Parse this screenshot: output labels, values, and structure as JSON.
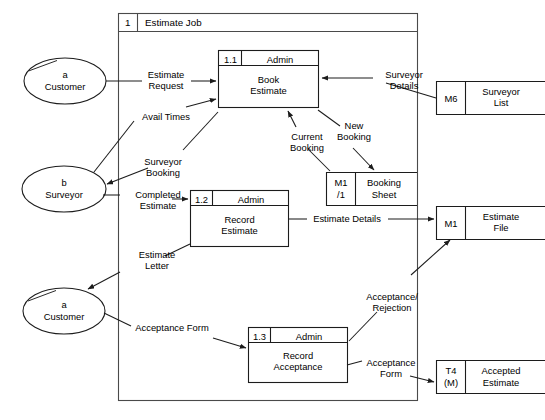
{
  "diagram": {
    "type": "data-flow-diagram",
    "title": "Estimate Job",
    "system_boundary": {
      "ref": "1",
      "label": "Estimate Job"
    },
    "external_entities": [
      {
        "id": "ext-customer-top",
        "ref": "a",
        "label": "Customer"
      },
      {
        "id": "ext-surveyor",
        "ref": "b",
        "label": "Surveyor"
      },
      {
        "id": "ext-customer-bottom",
        "ref": "a",
        "label": "Customer"
      }
    ],
    "processes": [
      {
        "id": "proc-1-1",
        "ref": "1.1",
        "actor": "Admin",
        "line1": "Book",
        "line2": "Estimate"
      },
      {
        "id": "proc-1-2",
        "ref": "1.2",
        "actor": "Admin",
        "line1": "Record",
        "line2": "Estimate"
      },
      {
        "id": "proc-1-3",
        "ref": "1.3",
        "actor": "Admin",
        "line1": "Record",
        "line2": "Acceptance"
      }
    ],
    "data_stores": [
      {
        "id": "store-m6",
        "ref": "M6",
        "ref2": "",
        "line1": "Surveyor",
        "line2": "List"
      },
      {
        "id": "store-m1-1",
        "ref": "M1",
        "ref2": "/1",
        "line1": "Booking",
        "line2": "Sheet"
      },
      {
        "id": "store-m1",
        "ref": "M1",
        "ref2": "",
        "line1": "Estimate",
        "line2": "File"
      },
      {
        "id": "store-t4",
        "ref": "T4",
        "ref2": "(M)",
        "line1": "Accepted",
        "line2": "Estimate"
      }
    ],
    "data_flows": [
      {
        "id": "flow-estimate-request",
        "line1": "Estimate",
        "line2": "Request"
      },
      {
        "id": "flow-avail-times",
        "line1": "Avail Times",
        "line2": ""
      },
      {
        "id": "flow-surveyor-details",
        "line1": "Surveyor",
        "line2": "Details"
      },
      {
        "id": "flow-current-booking",
        "line1": "Current",
        "line2": "Booking"
      },
      {
        "id": "flow-new-booking",
        "line1": "New",
        "line2": "Booking"
      },
      {
        "id": "flow-surveyor-booking",
        "line1": "Surveyor",
        "line2": "Booking"
      },
      {
        "id": "flow-completed-estimate",
        "line1": "Completed",
        "line2": "Estimate"
      },
      {
        "id": "flow-estimate-details",
        "line1": "Estimate Details",
        "line2": ""
      },
      {
        "id": "flow-estimate-letter",
        "line1": "Estimate",
        "line2": "Letter"
      },
      {
        "id": "flow-acceptance-form-in",
        "line1": "Acceptance Form",
        "line2": ""
      },
      {
        "id": "flow-acceptance-rejection",
        "line1": "Acceptance/",
        "line2": "Rejection"
      },
      {
        "id": "flow-acceptance-form-out",
        "line1": "Acceptance",
        "line2": "Form"
      }
    ],
    "colors": {
      "stroke": "#1c1c1c",
      "boundary": "#4a4a4a",
      "background": "#ffffff"
    }
  }
}
